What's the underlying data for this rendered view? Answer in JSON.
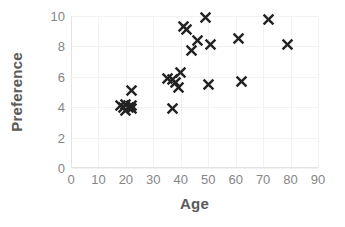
{
  "chart_data": {
    "type": "scatter",
    "title": "",
    "xlabel": "Age",
    "ylabel": "Preference",
    "xlim": [
      0,
      90
    ],
    "ylim": [
      0,
      10
    ],
    "xticks": [
      0,
      10,
      20,
      30,
      40,
      50,
      60,
      70,
      80,
      90
    ],
    "yticks": [
      0,
      2,
      4,
      6,
      8,
      10
    ],
    "grid": true,
    "legend": false,
    "marker": "x",
    "marker_color": "#222222",
    "gridline_color": "#f2f2f2",
    "axis_color": "#e4e4e4",
    "tick_label_color": "#868686",
    "axis_title_color": "#5a5a5a",
    "background_color": "#ffffff",
    "n_points": 27,
    "points": [
      {
        "x": 18,
        "y": 4.1
      },
      {
        "x": 19,
        "y": 4.0
      },
      {
        "x": 20,
        "y": 3.8
      },
      {
        "x": 20,
        "y": 4.2
      },
      {
        "x": 21,
        "y": 4.0
      },
      {
        "x": 22,
        "y": 3.9
      },
      {
        "x": 22,
        "y": 4.1
      },
      {
        "x": 22,
        "y": 5.1
      },
      {
        "x": 35,
        "y": 5.9
      },
      {
        "x": 37,
        "y": 3.9
      },
      {
        "x": 37,
        "y": 5.8
      },
      {
        "x": 38,
        "y": 5.6
      },
      {
        "x": 39,
        "y": 5.3
      },
      {
        "x": 40,
        "y": 6.3
      },
      {
        "x": 41,
        "y": 9.3
      },
      {
        "x": 42,
        "y": 9.1
      },
      {
        "x": 44,
        "y": 7.7
      },
      {
        "x": 46,
        "y": 8.4
      },
      {
        "x": 49,
        "y": 9.9
      },
      {
        "x": 50,
        "y": 5.5
      },
      {
        "x": 51,
        "y": 8.1
      },
      {
        "x": 61,
        "y": 8.5
      },
      {
        "x": 62,
        "y": 5.7
      },
      {
        "x": 72,
        "y": 9.8
      },
      {
        "x": 79,
        "y": 8.1
      }
    ]
  }
}
